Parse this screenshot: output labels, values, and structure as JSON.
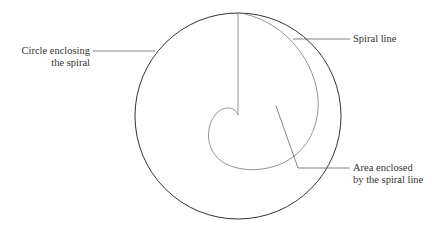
{
  "labels": {
    "circle": [
      "Circle enclosing",
      "the spiral"
    ],
    "spiral": "Spiral line",
    "area": [
      "Area enclosed",
      "by the spiral line"
    ]
  },
  "colors": {
    "circle": "#333333",
    "spiral": "#777777",
    "leader": "#666666"
  }
}
